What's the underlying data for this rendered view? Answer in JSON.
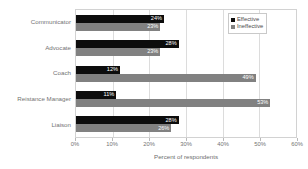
{
  "chart_data": {
    "type": "bar",
    "orientation": "horizontal",
    "title": "",
    "xlabel": "Percent of respondents",
    "ylabel": "",
    "xlim": [
      0,
      60
    ],
    "xticks": [
      "0%",
      "10%",
      "20%",
      "30%",
      "40%",
      "50%",
      "60%"
    ],
    "xtick_values": [
      0,
      10,
      20,
      30,
      40,
      50,
      60
    ],
    "grid": true,
    "legend_position": "top-right",
    "categories": [
      "Communicator",
      "Advocate",
      "Coach",
      "Reistance Manager",
      "Liaison"
    ],
    "series": [
      {
        "name": "Effective",
        "color": "#0d0d0d",
        "values": [
          24,
          28,
          12,
          11,
          28
        ],
        "labels": [
          "24%",
          "28%",
          "12%",
          "11%",
          "28%"
        ]
      },
      {
        "name": "Ineffective",
        "color": "#818181",
        "values": [
          23,
          23,
          49,
          53,
          26
        ],
        "labels": [
          "23%",
          "23%",
          "49%",
          "53%",
          "26%"
        ]
      }
    ]
  },
  "legend": {
    "items": [
      {
        "label": "Effective",
        "marker": "square-marker"
      },
      {
        "label": "Ineffective",
        "marker": "square-marker"
      }
    ]
  }
}
